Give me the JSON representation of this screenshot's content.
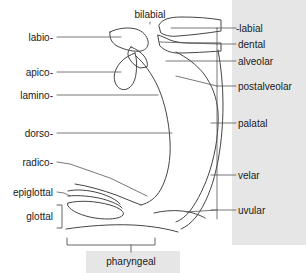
{
  "figure": {
    "title": "bilabial",
    "bottom_label": "pharyngeal",
    "panel_color": "#e6e6e6",
    "stroke_color": "#444444",
    "background_color": "#ffffff"
  },
  "top_labels": [
    {
      "id": "bilabial",
      "text": "bilabial",
      "x": 150,
      "y": 9
    }
  ],
  "left_labels": [
    {
      "id": "labio",
      "text": "labio-",
      "y": 32
    },
    {
      "id": "apico",
      "text": "apico-",
      "y": 67
    },
    {
      "id": "lamino",
      "text": "lamino-",
      "y": 90
    },
    {
      "id": "dorso",
      "text": "dorso-",
      "y": 128
    },
    {
      "id": "radico",
      "text": "radico-",
      "y": 157
    },
    {
      "id": "epiglottal",
      "text": "epiglottal",
      "y": 187
    },
    {
      "id": "glottal",
      "text": "glottal",
      "y": 211
    }
  ],
  "right_labels": [
    {
      "id": "labial",
      "text": "-labial",
      "y": 23
    },
    {
      "id": "dental",
      "text": "dental",
      "y": 39
    },
    {
      "id": "alveolar",
      "text": "alveolar",
      "y": 56
    },
    {
      "id": "postalveolar",
      "text": "postalveolar",
      "y": 81
    },
    {
      "id": "palatal",
      "text": "palatal",
      "y": 118
    },
    {
      "id": "velar",
      "text": "velar",
      "y": 170
    },
    {
      "id": "uvular",
      "text": "uvular",
      "y": 205
    }
  ],
  "bottom_labels": [
    {
      "id": "pharyngeal",
      "text": "pharyngeal",
      "x": 131,
      "y": 256
    }
  ],
  "brackets": [
    {
      "id": "glottal-bracket",
      "orientation": "right-square"
    },
    {
      "id": "pharyngeal-bracket",
      "orientation": "down-span"
    }
  ]
}
